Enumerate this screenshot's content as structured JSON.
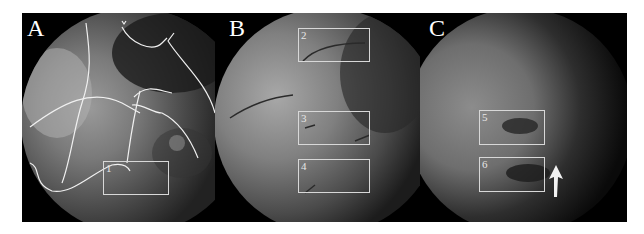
{
  "figure": {
    "panels": [
      {
        "label": "A",
        "boxes": [
          {
            "number": "1"
          }
        ],
        "overlay": "traced-vessel-outlines"
      },
      {
        "label": "B",
        "boxes": [
          {
            "number": "2"
          },
          {
            "number": "3"
          },
          {
            "number": "4"
          }
        ]
      },
      {
        "label": "C",
        "boxes": [
          {
            "number": "5"
          },
          {
            "number": "6"
          }
        ],
        "annotation": "white-arrow"
      }
    ],
    "colors": {
      "background": "#ffffff",
      "frame": "#000000",
      "box_outline": "#d8d8d8",
      "text": "#ffffff"
    }
  }
}
